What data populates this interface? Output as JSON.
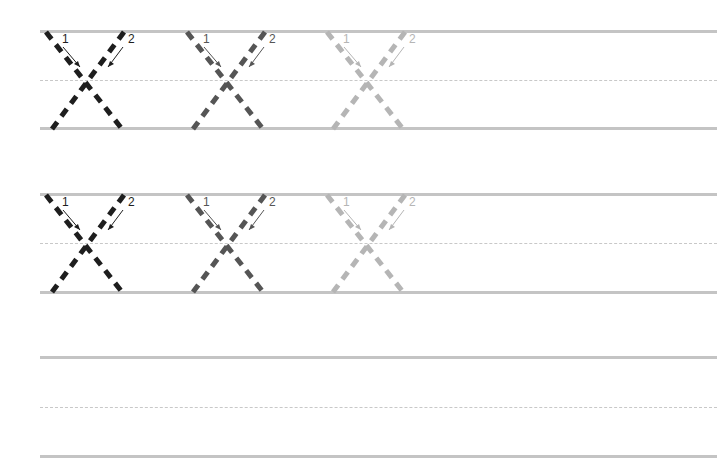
{
  "worksheet": {
    "letter": "X",
    "stroke_numbers": [
      "1",
      "2"
    ],
    "colors": {
      "dark": "#1e1e1e",
      "medium": "#555555",
      "light": "#b5b5b5",
      "rule": "#c4c4c4"
    },
    "rows": [
      {
        "index": 1,
        "top_y": 31,
        "mid_y": 80,
        "bottom_y": 128,
        "letters": [
          {
            "x": 44,
            "shade": "dark"
          },
          {
            "x": 185,
            "shade": "medium"
          },
          {
            "x": 325,
            "shade": "light"
          }
        ]
      },
      {
        "index": 2,
        "top_y": 194,
        "mid_y": 243,
        "bottom_y": 292,
        "letters": [
          {
            "x": 44,
            "shade": "dark"
          },
          {
            "x": 185,
            "shade": "medium"
          },
          {
            "x": 325,
            "shade": "light"
          }
        ]
      },
      {
        "index": 3,
        "top_y": 357,
        "mid_y": 407,
        "bottom_y": 456,
        "letters": []
      }
    ]
  }
}
